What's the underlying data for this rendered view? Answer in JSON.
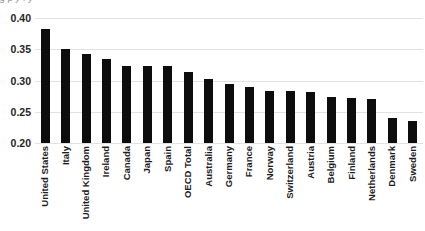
{
  "title_remnant": "g             p  y           f   y",
  "chart_data": {
    "type": "bar",
    "title": "",
    "subtitle": "",
    "xlabel": "",
    "ylabel": "",
    "ylim": [
      0.2,
      0.4
    ],
    "ytick_values": [
      0.4,
      0.35,
      0.3,
      0.25,
      0.2
    ],
    "ytick_labels": [
      "0.40",
      "0.35",
      "0.30",
      "0.25",
      "0.20"
    ],
    "grid": true,
    "legend": false,
    "bar_color": "#0d0d0d",
    "gridline_color": "#e2e2e2",
    "categories": [
      "United States",
      "Italy",
      "United Kingdom",
      "Ireland",
      "Canada",
      "Japan",
      "Spain",
      "OECD Total",
      "Australia",
      "Germany",
      "France",
      "Norway",
      "Switzerland",
      "Austria",
      "Belgium",
      "Finland",
      "Netherlands",
      "Denmark",
      "Sweden"
    ],
    "values": [
      0.382,
      0.35,
      0.343,
      0.334,
      0.323,
      0.323,
      0.323,
      0.313,
      0.303,
      0.295,
      0.289,
      0.283,
      0.283,
      0.282,
      0.274,
      0.272,
      0.271,
      0.24,
      0.235
    ]
  }
}
